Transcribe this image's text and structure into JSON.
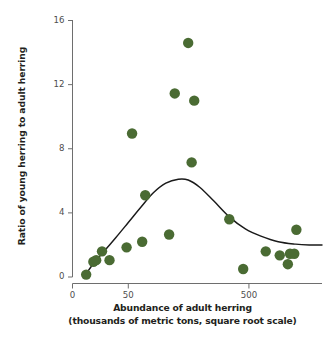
{
  "chart_data": {
    "type": "scatter",
    "title": "",
    "xlabel": "Abundance of adult herring",
    "xlabel_line2": "(thousands of metric tons, square root scale)",
    "ylabel": "Ratio of young herring to adult herring",
    "xscale": "sqrt",
    "xticks": [
      0,
      50,
      500
    ],
    "xtick_labels": [
      "0",
      "50",
      "500"
    ],
    "yticks": [
      0,
      4,
      8,
      12,
      16
    ],
    "ytick_labels": [
      "0",
      "4",
      "8",
      "12",
      "16"
    ],
    "xlim": [
      0,
      1000
    ],
    "ylim": [
      0,
      16
    ],
    "grid": false,
    "legend": false,
    "marker_color": "#4a6b33",
    "marker_size": 5.2,
    "line_color": "#1a1a1a",
    "points": [
      {
        "x": 3,
        "y": 0.15
      },
      {
        "x": 7,
        "y": 0.95
      },
      {
        "x": 9,
        "y": 1.05
      },
      {
        "x": 14,
        "y": 1.6
      },
      {
        "x": 22,
        "y": 1.05
      },
      {
        "x": 47,
        "y": 1.85
      },
      {
        "x": 57,
        "y": 8.95
      },
      {
        "x": 78,
        "y": 2.2
      },
      {
        "x": 85,
        "y": 5.1
      },
      {
        "x": 150,
        "y": 2.65
      },
      {
        "x": 168,
        "y": 11.45
      },
      {
        "x": 215,
        "y": 14.6
      },
      {
        "x": 228,
        "y": 7.15
      },
      {
        "x": 238,
        "y": 11.0
      },
      {
        "x": 395,
        "y": 3.6
      },
      {
        "x": 468,
        "y": 0.5
      },
      {
        "x": 600,
        "y": 1.6
      },
      {
        "x": 690,
        "y": 1.35
      },
      {
        "x": 745,
        "y": 0.8
      },
      {
        "x": 760,
        "y": 1.45
      },
      {
        "x": 790,
        "y": 1.45
      },
      {
        "x": 805,
        "y": 2.95
      }
    ],
    "fit_curve": {
      "name": "smoothed trend",
      "description": "LOESS-style smooth rising to a peak near 6.1 then declining to about 2.0",
      "points": [
        {
          "x": 3,
          "y": 0.2
        },
        {
          "x": 8,
          "y": 0.95
        },
        {
          "x": 16,
          "y": 1.6
        },
        {
          "x": 30,
          "y": 2.45
        },
        {
          "x": 50,
          "y": 3.4
        },
        {
          "x": 75,
          "y": 4.35
        },
        {
          "x": 105,
          "y": 5.25
        },
        {
          "x": 140,
          "y": 5.85
        },
        {
          "x": 180,
          "y": 6.1
        },
        {
          "x": 215,
          "y": 6.05
        },
        {
          "x": 260,
          "y": 5.6
        },
        {
          "x": 320,
          "y": 4.75
        },
        {
          "x": 395,
          "y": 3.75
        },
        {
          "x": 480,
          "y": 3.0
        },
        {
          "x": 570,
          "y": 2.55
        },
        {
          "x": 680,
          "y": 2.2
        },
        {
          "x": 800,
          "y": 2.05
        },
        {
          "x": 900,
          "y": 2.0
        },
        {
          "x": 1000,
          "y": 2.0
        }
      ]
    }
  },
  "axes": {
    "y_title": "Ratio of young herring to adult herring",
    "x_title_line1": "Abundance of adult herring",
    "x_title_line2": "(thousands of metric tons, square root scale)"
  }
}
